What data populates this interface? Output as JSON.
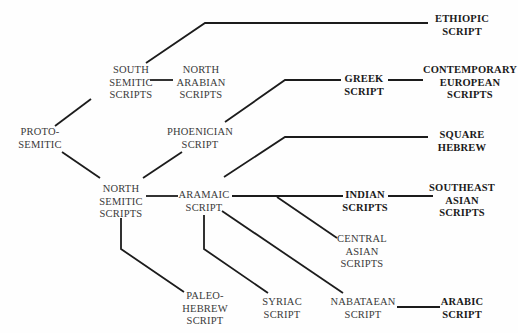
{
  "diagram": {
    "line_color": "#1c1c1c",
    "nodes": [
      {
        "id": "proto_semitic",
        "lines": [
          "PROTO-",
          "SEMITIC"
        ],
        "bold": false,
        "x": 40,
        "y": 126
      },
      {
        "id": "south_semitic",
        "lines": [
          "SOUTH",
          "SEMITIC",
          "SCRIPTS"
        ],
        "bold": false,
        "x": 131,
        "y": 64
      },
      {
        "id": "north_arabian",
        "lines": [
          "NORTH",
          "ARABIAN",
          "SCRIPTS"
        ],
        "bold": false,
        "x": 201,
        "y": 64
      },
      {
        "id": "ethiopic",
        "lines": [
          "ETHIOPIC",
          "SCRIPT"
        ],
        "bold": true,
        "x": 462,
        "y": 13
      },
      {
        "id": "phoenician",
        "lines": [
          "PHOENICIAN",
          "SCRIPT"
        ],
        "bold": false,
        "x": 200,
        "y": 126
      },
      {
        "id": "greek",
        "lines": [
          "GREEK",
          "SCRIPT"
        ],
        "bold": true,
        "x": 364,
        "y": 73
      },
      {
        "id": "contemporary_european",
        "lines": [
          "CONTEMPORARY",
          "EUROPEAN",
          "SCRIPTS"
        ],
        "bold": true,
        "x": 470,
        "y": 64
      },
      {
        "id": "north_semitic",
        "lines": [
          "NORTH",
          "SEMITIC",
          "SCRIPTS"
        ],
        "bold": false,
        "x": 121,
        "y": 183
      },
      {
        "id": "aramaic",
        "lines": [
          "ARAMAIC",
          "SCRIPT"
        ],
        "bold": false,
        "x": 204,
        "y": 189
      },
      {
        "id": "square_hebrew",
        "lines": [
          "SQUARE",
          "HEBREW"
        ],
        "bold": true,
        "x": 462,
        "y": 129
      },
      {
        "id": "indian",
        "lines": [
          "INDIAN",
          "SCRIPTS"
        ],
        "bold": true,
        "x": 365,
        "y": 189
      },
      {
        "id": "southeast_asian",
        "lines": [
          "SOUTHEAST",
          "ASIAN",
          "SCRIPTS"
        ],
        "bold": true,
        "x": 462,
        "y": 182
      },
      {
        "id": "central_asian",
        "lines": [
          "CENTRAL",
          "ASIAN",
          "SCRIPTS"
        ],
        "bold": false,
        "x": 362,
        "y": 233
      },
      {
        "id": "paleo_hebrew",
        "lines": [
          "PALEO-",
          "HEBREW",
          "SCRIPT"
        ],
        "bold": false,
        "x": 205,
        "y": 290
      },
      {
        "id": "syriac",
        "lines": [
          "SYRIAC",
          "SCRIPT"
        ],
        "bold": false,
        "x": 282,
        "y": 296
      },
      {
        "id": "nabataean",
        "lines": [
          "NABATAEAN",
          "SCRIPT"
        ],
        "bold": false,
        "x": 363,
        "y": 296
      },
      {
        "id": "arabic",
        "lines": [
          "ARABIC",
          "SCRIPT"
        ],
        "bold": true,
        "x": 462,
        "y": 296
      }
    ],
    "edges": [
      {
        "from": "proto_semitic",
        "to": "south_semitic",
        "points": [
          [
            55,
            126
          ],
          [
            91,
            99
          ]
        ]
      },
      {
        "from": "proto_semitic",
        "to": "north_semitic",
        "points": [
          [
            62,
            152
          ],
          [
            100,
            178
          ]
        ]
      },
      {
        "from": "south_semitic",
        "to": "ethiopic",
        "points": [
          [
            146,
            63
          ],
          [
            205,
            23
          ],
          [
            428,
            23
          ]
        ]
      },
      {
        "from": "south_semitic",
        "to": "north_arabian",
        "points": [
          [
            150,
            80
          ],
          [
            173,
            80
          ]
        ]
      },
      {
        "from": "north_semitic",
        "to": "phoenician",
        "points": [
          [
            143,
            178
          ],
          [
            182,
            152
          ]
        ]
      },
      {
        "from": "phoenician",
        "to": "greek",
        "points": [
          [
            225,
            122
          ],
          [
            285,
            80
          ],
          [
            341,
            80
          ]
        ]
      },
      {
        "from": "greek",
        "to": "contemporary_european",
        "points": [
          [
            388,
            80
          ],
          [
            423,
            80
          ]
        ]
      },
      {
        "from": "north_semitic",
        "to": "aramaic",
        "points": [
          [
            146,
            196
          ],
          [
            178,
            196
          ]
        ]
      },
      {
        "from": "north_semitic",
        "to": "paleo_hebrew",
        "points": [
          [
            121,
            218
          ],
          [
            121,
            249
          ],
          [
            184,
            292
          ]
        ]
      },
      {
        "from": "aramaic",
        "to": "square_hebrew",
        "points": [
          [
            224,
            177
          ],
          [
            285,
            137
          ],
          [
            428,
            137
          ]
        ]
      },
      {
        "from": "aramaic",
        "to": "indian",
        "points": [
          [
            232,
            196
          ],
          [
            343,
            196
          ]
        ]
      },
      {
        "from": "indian",
        "to": "southeast_asian",
        "points": [
          [
            388,
            196
          ],
          [
            433,
            196
          ]
        ]
      },
      {
        "from": "aramaic",
        "to": "central_asian",
        "points": [
          [
            277,
            197
          ],
          [
            337,
            238
          ]
        ]
      },
      {
        "from": "aramaic",
        "to": "syriac",
        "points": [
          [
            204,
            215
          ],
          [
            204,
            249
          ],
          [
            268,
            293
          ]
        ]
      },
      {
        "from": "aramaic",
        "to": "nabataean",
        "points": [
          [
            222,
            211
          ],
          [
            343,
            293
          ]
        ]
      },
      {
        "from": "nabataean",
        "to": "arabic",
        "points": [
          [
            397,
            307
          ],
          [
            440,
            307
          ]
        ]
      }
    ]
  }
}
